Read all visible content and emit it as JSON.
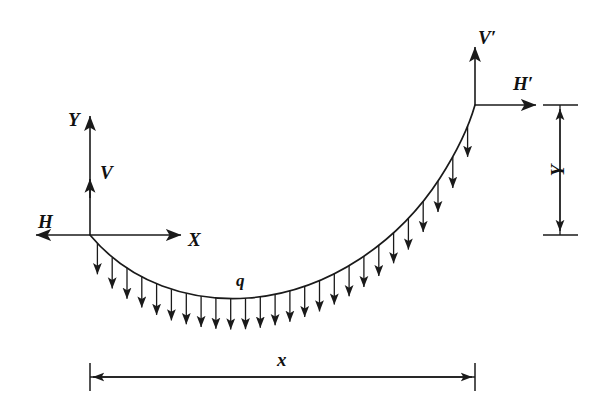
{
  "figure": {
    "type": "engineering-free-body-diagram",
    "background_color": "#ffffff",
    "line_color": "#1a1a1a"
  },
  "labels": {
    "y_axis": "Y",
    "x_axis": "X",
    "h_left": "H",
    "v_left": "V",
    "h_right": "H′",
    "v_right": "V′",
    "load": "q",
    "span_dimension": "x",
    "height_dimension": "Y"
  },
  "geometry": {
    "origin": {
      "x": 90,
      "y": 235
    },
    "right_support": {
      "x": 475,
      "y": 105
    },
    "lowest_point": {
      "x": 248,
      "y": 298
    },
    "span_px": 385,
    "rise_px": 130,
    "load_arrow_count": 26,
    "load_arrow_length_px": 35
  },
  "axes": {
    "y_axis_top": {
      "x": 90,
      "y": 112
    },
    "x_axis_right": {
      "x": 185,
      "y": 235
    },
    "h_arrow_tip": {
      "x": 33,
      "y": 235
    },
    "v_arrow_tip": {
      "x": 90,
      "y": 176
    }
  },
  "reactions": {
    "v_prime_tip": {
      "x": 475,
      "y": 43
    },
    "h_prime_tip": {
      "x": 540,
      "y": 105
    }
  },
  "dimensions": {
    "span": {
      "y": 377,
      "x_start": 90,
      "x_end": 475,
      "tick_half": 14
    },
    "height": {
      "x": 560,
      "y_top": 105,
      "y_bottom": 235,
      "tick_half": 17
    }
  },
  "chart_data": {
    "type": "line",
    "title": "",
    "xlabel": "X",
    "ylabel": "Y",
    "series": [
      {
        "name": "cable",
        "description": "parabolic / catenary cable profile from left support at origin to right support",
        "x": [
          0,
          20,
          40,
          60,
          80,
          100,
          120,
          140,
          160,
          180,
          200,
          220,
          240,
          260,
          280,
          300,
          320,
          340,
          360,
          385
        ],
        "y": [
          0,
          -24,
          -42,
          -55,
          -62,
          -65,
          -64,
          -59,
          -50,
          -38,
          -22,
          -3,
          19,
          43,
          68,
          92,
          111,
          124,
          129,
          130
        ]
      }
    ],
    "annotations": [
      {
        "text": "q",
        "x": 248,
        "y": 283,
        "meaning": "uniformly distributed load per unit horizontal length"
      },
      {
        "text": "H",
        "x": 45,
        "y": 222,
        "meaning": "horizontal reaction at left support"
      },
      {
        "text": "V",
        "x": 103,
        "y": 172,
        "meaning": "vertical reaction at left support"
      },
      {
        "text": "H′",
        "x": 519,
        "y": 84,
        "meaning": "horizontal reaction at right support"
      },
      {
        "text": "V′",
        "x": 481,
        "y": 38,
        "meaning": "vertical reaction at right support"
      },
      {
        "text": "x",
        "x": 283,
        "y": 360,
        "meaning": "horizontal span"
      },
      {
        "text": "Y",
        "x": 560,
        "y": 170,
        "meaning": "vertical rise between supports"
      }
    ],
    "grid": false,
    "legend": false
  }
}
